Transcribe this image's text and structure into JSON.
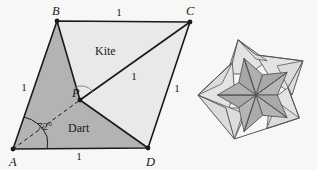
{
  "figure": {
    "background_color": "#f7f7f5",
    "stroke_color": "#1a1a1a",
    "kite_fill": "#e9e9e9",
    "dart_fill": "#b3b3b3",
    "star_light_fill": "#e3e3e3",
    "star_dark_fill": "#b0b0b0"
  },
  "rhombus": {
    "vertex_labels": [
      {
        "name": "B",
        "text": "B",
        "x": 52,
        "y": 15
      },
      {
        "name": "C",
        "text": "C",
        "x": 186,
        "y": 15
      },
      {
        "name": "A",
        "text": "A",
        "x": 9,
        "y": 166
      },
      {
        "name": "D",
        "text": "D",
        "x": 146,
        "y": 166
      },
      {
        "name": "P",
        "text": "P",
        "x": 72,
        "y": 97
      }
    ],
    "vertices": {
      "A": {
        "x": 13,
        "y": 149
      },
      "B": {
        "x": 57,
        "y": 21
      },
      "C": {
        "x": 190,
        "y": 22
      },
      "D": {
        "x": 148,
        "y": 148
      },
      "P": {
        "x": 80,
        "y": 100
      }
    },
    "edge_labels": [
      {
        "name": "edge-bc",
        "text": "1",
        "x": 119,
        "y": 16
      },
      {
        "name": "edge-ab",
        "text": "1",
        "x": 24,
        "y": 91
      },
      {
        "name": "edge-pc",
        "text": "1",
        "x": 134,
        "y": 80
      },
      {
        "name": "edge-cd",
        "text": "1",
        "x": 177,
        "y": 92
      },
      {
        "name": "edge-ad",
        "text": "1",
        "x": 79,
        "y": 160
      }
    ],
    "region_labels": [
      {
        "name": "kite",
        "text": "Kite",
        "x": 95,
        "y": 55
      },
      {
        "name": "dart",
        "text": "Dart",
        "x": 68,
        "y": 132
      }
    ],
    "angle_label": {
      "name": "angle-a",
      "text": "72°",
      "x": 37,
      "y": 130
    }
  },
  "star": {
    "center": {
      "x": 256,
      "y": 95
    },
    "outer_radius": 58,
    "inner_radius": 36,
    "points": 5
  }
}
